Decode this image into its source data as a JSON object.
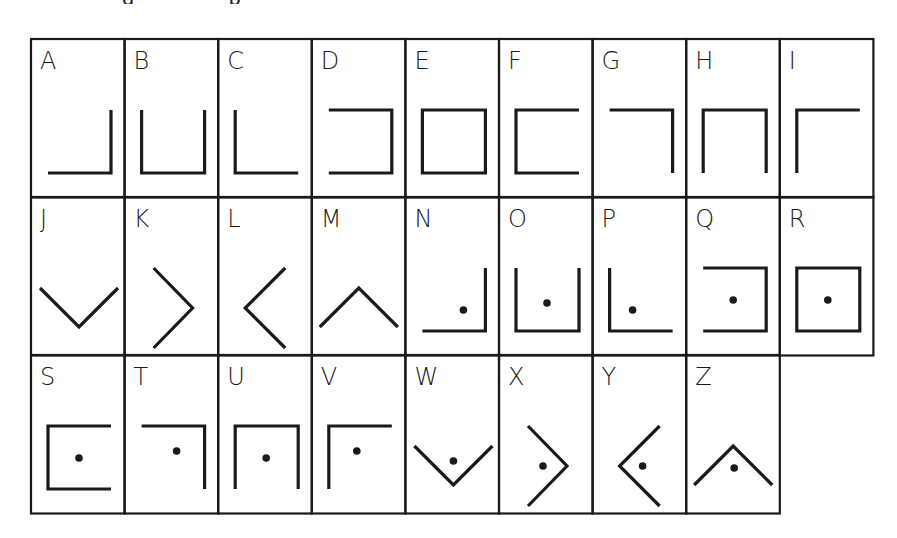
{
  "caption": {
    "clipped_fragments": [
      {
        "text": "g",
        "x": 122
      },
      {
        "text": "p",
        "x": 228
      }
    ]
  },
  "grid": {
    "left": 31,
    "top": 39,
    "col_width": 93.6,
    "row_tops": [
      39,
      197,
      355
    ],
    "row_height": 158.5,
    "line_color": "#1a1a1a",
    "rows": [
      [
        "A",
        "B",
        "C",
        "D",
        "E",
        "F",
        "G",
        "H",
        "I"
      ],
      [
        "J",
        "K",
        "L",
        "M",
        "N",
        "O",
        "P",
        "Q",
        "R"
      ],
      [
        "S",
        "T",
        "U",
        "V",
        "W",
        "X",
        "Y",
        "Z"
      ]
    ]
  },
  "cells": [
    {
      "letter": "A",
      "shape": "corner-bottom-right",
      "dot": false
    },
    {
      "letter": "B",
      "shape": "u-open-top",
      "dot": false
    },
    {
      "letter": "C",
      "shape": "corner-bottom-left",
      "dot": false
    },
    {
      "letter": "D",
      "shape": "bracket-open-left",
      "dot": false
    },
    {
      "letter": "E",
      "shape": "square",
      "dot": false
    },
    {
      "letter": "F",
      "shape": "bracket-open-right",
      "dot": false
    },
    {
      "letter": "G",
      "shape": "corner-top-right",
      "dot": false
    },
    {
      "letter": "H",
      "shape": "u-open-bottom",
      "dot": false
    },
    {
      "letter": "I",
      "shape": "corner-top-left",
      "dot": false
    },
    {
      "letter": "J",
      "shape": "v-down",
      "dot": false
    },
    {
      "letter": "K",
      "shape": "chevron-right",
      "dot": false
    },
    {
      "letter": "L",
      "shape": "chevron-left",
      "dot": false
    },
    {
      "letter": "M",
      "shape": "v-up",
      "dot": false
    },
    {
      "letter": "N",
      "shape": "corner-bottom-right",
      "dot": true
    },
    {
      "letter": "O",
      "shape": "u-open-top",
      "dot": true
    },
    {
      "letter": "P",
      "shape": "corner-bottom-left",
      "dot": true
    },
    {
      "letter": "Q",
      "shape": "bracket-open-left",
      "dot": true
    },
    {
      "letter": "R",
      "shape": "square",
      "dot": true
    },
    {
      "letter": "S",
      "shape": "bracket-open-right",
      "dot": true
    },
    {
      "letter": "T",
      "shape": "corner-top-right",
      "dot": true
    },
    {
      "letter": "U",
      "shape": "u-open-bottom",
      "dot": true
    },
    {
      "letter": "V",
      "shape": "corner-top-left",
      "dot": true
    },
    {
      "letter": "W",
      "shape": "v-down",
      "dot": true
    },
    {
      "letter": "X",
      "shape": "chevron-right",
      "dot": true
    },
    {
      "letter": "Y",
      "shape": "chevron-left",
      "dot": true
    },
    {
      "letter": "Z",
      "shape": "v-up",
      "dot": true
    }
  ]
}
